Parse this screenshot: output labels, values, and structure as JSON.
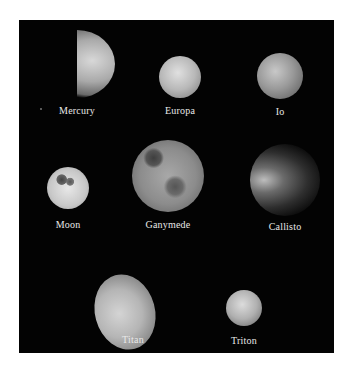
{
  "figure": {
    "background": "#030303",
    "bodies": [
      {
        "name": "Mercury",
        "label": "Mercury"
      },
      {
        "name": "Europa",
        "label": "Europa"
      },
      {
        "name": "Io",
        "label": "Io"
      },
      {
        "name": "Moon",
        "label": "Moon"
      },
      {
        "name": "Ganymede",
        "label": "Ganymede"
      },
      {
        "name": "Callisto",
        "label": "Callisto"
      },
      {
        "name": "Titan",
        "label": "Titan"
      },
      {
        "name": "Triton",
        "label": "Triton"
      }
    ]
  }
}
